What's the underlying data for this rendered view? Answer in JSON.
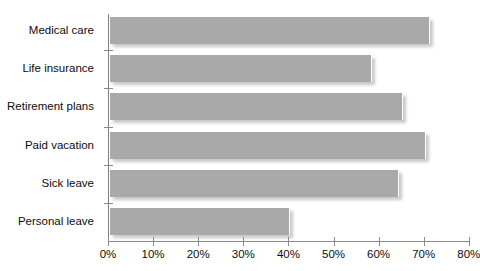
{
  "chart_data": {
    "type": "bar",
    "orientation": "horizontal",
    "title": "",
    "xlabel": "",
    "ylabel": "",
    "categories": [
      "Medical care",
      "Life insurance",
      "Retirement plans",
      "Paid vacation",
      "Sick leave",
      "Personal leave"
    ],
    "values": [
      71,
      58,
      65,
      70,
      64,
      40
    ],
    "xlim": [
      0,
      80
    ],
    "xticks": [
      0,
      10,
      20,
      30,
      40,
      50,
      60,
      70,
      80
    ],
    "xtick_labels": [
      "0%",
      "10%",
      "20%",
      "30%",
      "40%",
      "50%",
      "60%",
      "70%",
      "80%"
    ],
    "grid": false,
    "legend": false,
    "bar_color": "#a9a9a9",
    "axis_color": "#8a8a8a",
    "text_color": "#0d0d0d"
  },
  "title_remnant": ""
}
